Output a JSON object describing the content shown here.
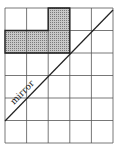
{
  "diagram": {
    "grid": {
      "cols": 5,
      "rows": 6,
      "x0": 5,
      "y0": 8,
      "cell_w": 21.6,
      "cell_h": 22.5
    },
    "shaded_cells": [
      [
        0,
        2
      ],
      [
        1,
        0
      ],
      [
        1,
        1
      ],
      [
        1,
        2
      ]
    ],
    "mirror_label": "mirror",
    "colors": {
      "line": "#333333",
      "shade": "#b0b0b0",
      "shade_border": "#222222"
    }
  }
}
